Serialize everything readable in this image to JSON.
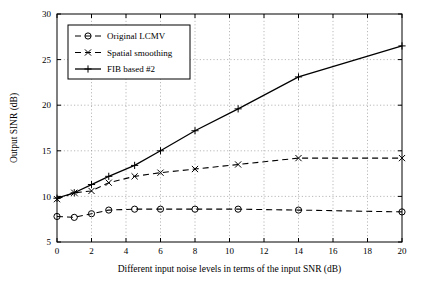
{
  "chart_data": {
    "type": "line",
    "title": "",
    "xlabel": "Different input noise levels in terms of the input SNR (dB)",
    "ylabel": "Output SINR (dB)",
    "xlim": [
      0,
      20
    ],
    "ylim": [
      5,
      30
    ],
    "xticks": [
      0,
      2,
      4,
      6,
      8,
      10,
      12,
      14,
      16,
      18,
      20
    ],
    "yticks": [
      5,
      10,
      15,
      20,
      25,
      30
    ],
    "grid": true,
    "legend_position": "upper-left",
    "x": [
      0,
      1,
      2,
      3,
      4.5,
      6,
      8,
      10.5,
      14,
      20
    ],
    "series": [
      {
        "name": "Original LCMV",
        "marker": "circle",
        "linestyle": "dashed",
        "color": "#000000",
        "values": [
          7.8,
          7.7,
          8.1,
          8.5,
          8.6,
          8.6,
          8.6,
          8.6,
          8.5,
          8.3
        ]
      },
      {
        "name": "Spatial smoothing",
        "marker": "x",
        "linestyle": "dashed",
        "color": "#000000",
        "values": [
          9.7,
          10.4,
          10.6,
          11.5,
          12.2,
          12.6,
          13.0,
          13.5,
          14.2,
          14.2
        ]
      },
      {
        "name": "FIB based #2",
        "marker": "plus",
        "linestyle": "solid",
        "color": "#000000",
        "values": [
          9.8,
          10.4,
          11.3,
          12.2,
          13.4,
          15.0,
          17.2,
          19.6,
          23.1,
          26.5
        ]
      }
    ]
  },
  "legend": {
    "items": [
      {
        "label": "Original LCMV"
      },
      {
        "label": "Spatial smoothing"
      },
      {
        "label": "FIB based #2"
      }
    ]
  },
  "axes": {
    "x_label": "Different input noise levels in terms of the input SNR (dB)",
    "y_label": "Output SINR (dB)",
    "x_tick_labels": [
      "0",
      "2",
      "4",
      "6",
      "8",
      "10",
      "12",
      "14",
      "16",
      "18",
      "20"
    ],
    "y_tick_labels": [
      "5",
      "10",
      "15",
      "20",
      "25",
      "30"
    ]
  }
}
